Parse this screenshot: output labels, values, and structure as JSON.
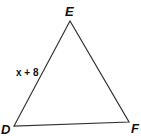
{
  "diagram": {
    "type": "triangle",
    "stroke_color": "#333333",
    "vertices": [
      {
        "id": "E",
        "label": "E",
        "x": 70,
        "y": 21
      },
      {
        "id": "D",
        "label": "D",
        "x": 14,
        "y": 126
      },
      {
        "id": "F",
        "label": "F",
        "x": 129,
        "y": 122
      }
    ],
    "side_labels": [
      {
        "side": "DE",
        "text": "x + 8"
      }
    ]
  }
}
